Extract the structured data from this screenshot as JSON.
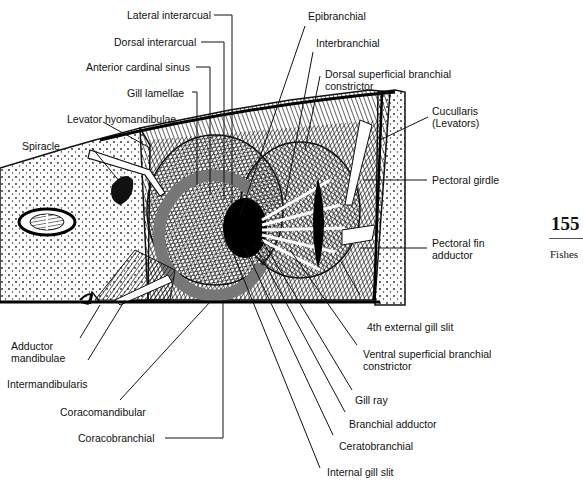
{
  "figure": {
    "labels": {
      "lateral_interarcual": "Lateral interarcual",
      "dorsal_interarcual": "Dorsal interarcual",
      "anterior_cardinal_sinus": "Anterior cardinal sinus",
      "gill_lamellae": "Gill lamellae",
      "levator_hyomandibulae": "Levator hyomandibulae",
      "spiracle": "Spiracle",
      "epibranchial": "Epibranchial",
      "interbranchial": "Interbranchial",
      "dorsal_superficial_branchial_constrictor": "Dorsal superficial branchial constrictor",
      "cucullaris": "Cucullaris (Levators)",
      "pectoral_girdle": "Pectoral girdle",
      "pectoral_fin_adductor": "Pectoral fin adductor",
      "adductor_mandibulae": "Adductor mandibulae",
      "intermandibularis": "Intermandibularis",
      "coracomandibular": "Coracomandibular",
      "coracobranchial": "Coracobranchial",
      "fourth_external_gill_slit": "4th external gill slit",
      "ventral_superficial_branchial_constrictor": "Ventral superficial branchial constrictor",
      "gill_ray": "Gill ray",
      "branchial_adductor": "Branchial adductor",
      "ceratobranchial": "Ceratobranchial",
      "internal_gill_slit": "Internal gill slit"
    }
  },
  "page": {
    "number": "155",
    "section": "Fishes"
  }
}
